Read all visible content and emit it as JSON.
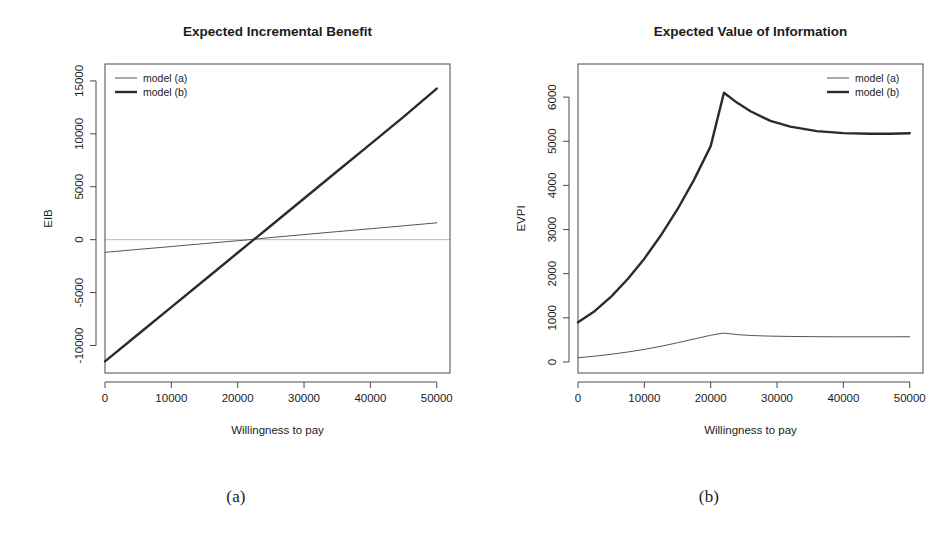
{
  "figure": {
    "caption_a": "(a)",
    "caption_b": "(b)"
  },
  "chart_data": [
    {
      "id": "eib",
      "type": "line",
      "title": "Expected Incremental Benefit",
      "xlabel": "Willingness to pay",
      "ylabel": "EIB",
      "xlim": [
        0,
        52000
      ],
      "ylim": [
        -12600,
        16600
      ],
      "xticks": [
        0,
        10000,
        20000,
        30000,
        40000,
        50000
      ],
      "xticklabels": [
        "0",
        "10000",
        "20000",
        "30000",
        "40000",
        "50000"
      ],
      "yticks": [
        -10000,
        -5000,
        0,
        5000,
        10000,
        15000
      ],
      "yticklabels": [
        "-10000",
        "-5000",
        "0",
        "5000",
        "10000",
        "15000"
      ],
      "grid": false,
      "zero_line": true,
      "zero_line_color": "#b9b9b9",
      "legend_position": "top-left",
      "legend": [
        "model (a)",
        "model (b)"
      ],
      "x": [
        0,
        5000,
        10000,
        15000,
        20000,
        21500,
        25000,
        30000,
        35000,
        40000,
        45000,
        50000
      ],
      "series": [
        {
          "name": "model (a)",
          "color": "#555555",
          "linewidth": 1,
          "values": [
            -1200,
            -920,
            -650,
            -370,
            -100,
            -20,
            200,
            480,
            760,
            1030,
            1310,
            1590
          ]
        },
        {
          "name": "model (b)",
          "color": "#2b2b2b",
          "linewidth": 2.4,
          "values": [
            -11500,
            -8940,
            -6370,
            -3810,
            -1240,
            -470,
            1320,
            3890,
            6460,
            9030,
            11600,
            14280
          ]
        }
      ]
    },
    {
      "id": "evpi",
      "type": "line",
      "title": "Expected Value of Information",
      "xlabel": "Willingness to pay",
      "ylabel": "EVPI",
      "xlim": [
        0,
        52000
      ],
      "ylim": [
        -250,
        6750
      ],
      "xticks": [
        0,
        10000,
        20000,
        30000,
        40000,
        50000
      ],
      "xticklabels": [
        "0",
        "10000",
        "20000",
        "30000",
        "40000",
        "50000"
      ],
      "yticks": [
        0,
        1000,
        2000,
        3000,
        4000,
        5000,
        6000
      ],
      "yticklabels": [
        "0",
        "1000",
        "2000",
        "3000",
        "4000",
        "5000",
        "6000"
      ],
      "grid": false,
      "zero_line": false,
      "legend_position": "top-right",
      "legend": [
        "model (a)",
        "model (b)"
      ],
      "x": [
        0,
        2500,
        5000,
        7500,
        10000,
        12500,
        15000,
        17500,
        20000,
        22000,
        24000,
        26000,
        29000,
        32000,
        36000,
        40000,
        44000,
        47000,
        50000
      ],
      "series": [
        {
          "name": "model (a)",
          "color": "#555555",
          "linewidth": 1,
          "values": [
            95,
            130,
            175,
            225,
            285,
            355,
            435,
            520,
            605,
            655,
            620,
            600,
            585,
            578,
            572,
            570,
            570,
            570,
            572
          ]
        },
        {
          "name": "model (b)",
          "color": "#2b2b2b",
          "linewidth": 2.4,
          "values": [
            900,
            1150,
            1480,
            1880,
            2340,
            2870,
            3460,
            4130,
            4890,
            6100,
            5870,
            5680,
            5460,
            5330,
            5230,
            5185,
            5170,
            5170,
            5180
          ]
        }
      ]
    }
  ]
}
